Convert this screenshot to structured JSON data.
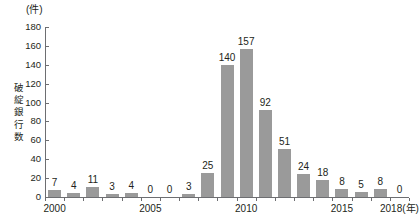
{
  "chart_data": {
    "type": "bar",
    "title": "",
    "subtitle": "",
    "unit_label": "(件)",
    "ylabel": "破綻銀行数",
    "xlabel": "(年)",
    "xlabel_full": "2018(年)",
    "categories": [
      "2000",
      "2001",
      "2002",
      "2003",
      "2004",
      "2005",
      "2006",
      "2007",
      "2008",
      "2009",
      "2010",
      "2011",
      "2012",
      "2013",
      "2014",
      "2015",
      "2016",
      "2017",
      "2018"
    ],
    "values": [
      7,
      4,
      11,
      3,
      4,
      0,
      0,
      3,
      25,
      140,
      157,
      92,
      51,
      24,
      18,
      8,
      5,
      8,
      0
    ],
    "data_labels": [
      "7",
      "4",
      "11",
      "3",
      "4",
      "0",
      "0",
      "3",
      "25",
      "140",
      "157",
      "92",
      "51",
      "24",
      "18",
      "8",
      "5",
      "8",
      "0"
    ],
    "ylim": [
      0,
      180
    ],
    "ytick_values": [
      0,
      20,
      40,
      60,
      80,
      100,
      120,
      140,
      160,
      180
    ],
    "ytick_labels": [
      "0",
      "20",
      "40",
      "60",
      "80",
      "100",
      "120",
      "140",
      "160",
      "180"
    ],
    "xtick_labels": [
      "2000",
      "2005",
      "2010",
      "2015",
      "2018(年)"
    ],
    "xtick_categories": [
      "2000",
      "2005",
      "2010",
      "2015",
      "2018"
    ],
    "grid": false,
    "legend": false,
    "legend_position": "none",
    "bar_color": "#9a9a9a",
    "axis_color": "#6d6e71",
    "text_color": "#231f20",
    "background_color": "#ffffff"
  },
  "axis_title_chars": [
    "破",
    "綻",
    "銀",
    "行",
    "数"
  ]
}
